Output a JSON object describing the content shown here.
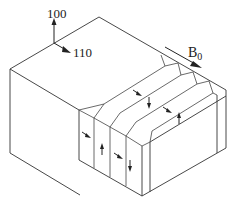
{
  "figure": {
    "labels": {
      "axis_100": "100",
      "axis_110": "110",
      "field": "B",
      "field_subscript": "0"
    },
    "domains": {
      "count": 4,
      "front_face_magnetization": [
        "diagonal-down-right",
        "up",
        "diagonal-down-right",
        "down"
      ],
      "top_face_magnetization": [
        "diagonal-down-right",
        "down",
        "diagonal-down-right",
        "up"
      ]
    }
  }
}
